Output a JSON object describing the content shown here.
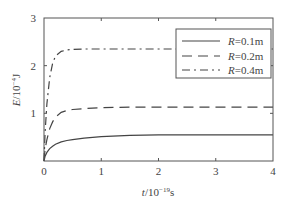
{
  "chart_data": {
    "type": "line",
    "title": "",
    "xlabel": "t/10^-19 s",
    "ylabel": "E/10^-4 J",
    "xlabel_parts": {
      "var": "t",
      "base": "/10",
      "exp": "−19",
      "unit": "s"
    },
    "ylabel_parts": {
      "var": "E",
      "base": "/10",
      "exp": "−4",
      "unit": "J"
    },
    "xlim": [
      0,
      4
    ],
    "ylim": [
      0,
      3
    ],
    "xticks": [
      "0",
      "1",
      "2",
      "3",
      "4"
    ],
    "yticks": [
      "0",
      "1",
      "2",
      "3"
    ],
    "grid": false,
    "legend_position": "upper right",
    "x": [
      0,
      0.02,
      0.05,
      0.1,
      0.15,
      0.2,
      0.3,
      0.4,
      0.5,
      0.7,
      1.0,
      1.5,
      2.0,
      2.5,
      3.0,
      3.5,
      4.0
    ],
    "series": [
      {
        "name": "R=0.1m",
        "label_var": "R",
        "label_rest": "=0.1m",
        "style": "solid",
        "values": [
          0,
          0.1,
          0.18,
          0.26,
          0.31,
          0.35,
          0.4,
          0.43,
          0.45,
          0.48,
          0.51,
          0.54,
          0.55,
          0.55,
          0.55,
          0.55,
          0.55
        ]
      },
      {
        "name": "R=0.2m",
        "label_var": "R",
        "label_rest": "=0.2m",
        "style": "dashed",
        "values": [
          0,
          0.25,
          0.45,
          0.68,
          0.82,
          0.92,
          1.02,
          1.06,
          1.08,
          1.1,
          1.12,
          1.13,
          1.13,
          1.13,
          1.13,
          1.13,
          1.13
        ]
      },
      {
        "name": "R=0.4m",
        "label_var": "R",
        "label_rest": "=0.4m",
        "style": "dashdot",
        "values": [
          0,
          0.6,
          1.2,
          1.75,
          2.05,
          2.2,
          2.3,
          2.33,
          2.34,
          2.35,
          2.35,
          2.35,
          2.35,
          2.35,
          2.35,
          2.35,
          2.35
        ]
      }
    ]
  },
  "colors": {
    "axis": "#555555",
    "line": "#444444",
    "background": "#ffffff"
  }
}
